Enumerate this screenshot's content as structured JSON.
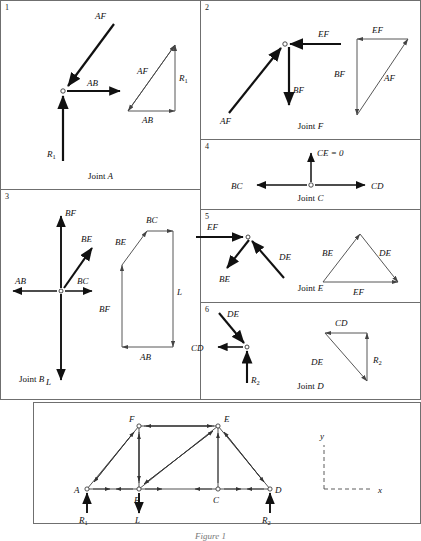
{
  "figure": {
    "caption": "Figure 1",
    "panels": [
      {
        "number": "1",
        "caption_prefix": "Joint ",
        "caption_joint": "A",
        "joint_labels": [
          "AF",
          "AB",
          "R1"
        ],
        "polygon_labels": [
          "AF",
          "R1",
          "AB"
        ]
      },
      {
        "number": "2",
        "caption_prefix": "Joint ",
        "caption_joint": "F",
        "joint_labels": [
          "EF",
          "BF",
          "AF"
        ],
        "polygon_labels": [
          "EF",
          "BF",
          "AF"
        ]
      },
      {
        "number": "3",
        "caption_prefix": "Joint ",
        "caption_joint": "B",
        "joint_labels": [
          "BF",
          "BE",
          "BC",
          "AB",
          "L"
        ],
        "polygon_labels": [
          "BC",
          "BE",
          "BF",
          "L",
          "AB"
        ]
      },
      {
        "number": "4",
        "caption_prefix": "Joint ",
        "caption_joint": "C",
        "joint_labels": [
          "CE = 0",
          "BC",
          "CD"
        ],
        "polygon_labels": []
      },
      {
        "number": "5",
        "caption_prefix": "Joint ",
        "caption_joint": "E",
        "joint_labels": [
          "EF",
          "BE",
          "DE"
        ],
        "polygon_labels": [
          "BE",
          "DE",
          "EF"
        ]
      },
      {
        "number": "6",
        "caption_prefix": "Joint ",
        "caption_joint": "D",
        "joint_labels": [
          "DE",
          "CD",
          "R2"
        ],
        "polygon_labels": [
          "CD",
          "DE",
          "R2"
        ]
      }
    ],
    "truss": {
      "joints": [
        "A",
        "B",
        "C",
        "D",
        "E",
        "F"
      ],
      "loads": [
        "R1",
        "L",
        "R2"
      ],
      "axes": [
        "y",
        "x"
      ]
    }
  },
  "text": {
    "p1_num": "1",
    "p2_num": "2",
    "p3_num": "3",
    "p4_num": "4",
    "p5_num": "5",
    "p6_num": "6",
    "joint_word": "Joint",
    "jA": "A",
    "jB": "B",
    "jC": "C",
    "jD": "D",
    "jE": "E",
    "jF": "F",
    "AF": "AF",
    "AB": "AB",
    "BF": "BF",
    "BE": "BE",
    "BC": "BC",
    "CD": "CD",
    "DE": "DE",
    "EF": "EF",
    "L": "L",
    "R": "R",
    "one": "1",
    "two": "2",
    "CE0": "CE = 0",
    "axis_x": "x",
    "axis_y": "y",
    "fig_caption": "Figure 1"
  }
}
